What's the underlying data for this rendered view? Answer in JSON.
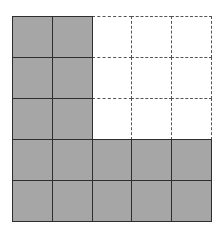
{
  "diagram": {
    "rows": 5,
    "cols": 5,
    "shaded_color": "#a6a6a6",
    "line_color": "#2e2e2e",
    "dashed_color": "#555555",
    "cells": [
      [
        "shaded",
        "shaded",
        "empty",
        "empty",
        "empty"
      ],
      [
        "shaded",
        "shaded",
        "empty",
        "empty",
        "empty"
      ],
      [
        "shaded",
        "shaded",
        "empty",
        "empty",
        "empty"
      ],
      [
        "shaded",
        "shaded",
        "shaded",
        "shaded",
        "shaded"
      ],
      [
        "shaded",
        "shaded",
        "shaded",
        "shaded",
        "shaded"
      ]
    ],
    "shaded_count": 16,
    "empty_count": 9
  }
}
